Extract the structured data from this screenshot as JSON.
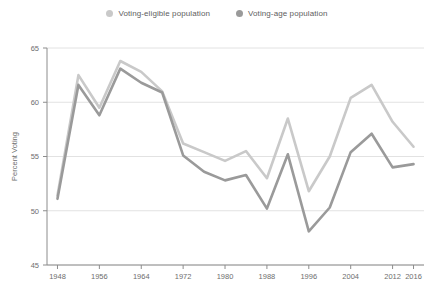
{
  "legend": {
    "position": "top-center",
    "items": [
      {
        "label": "Voting-eligible population",
        "color": "#c9c9c9",
        "marker": "circle-marker-icon"
      },
      {
        "label": "Voting-age population",
        "color": "#9a9a9a",
        "marker": "circle-marker-icon"
      }
    ]
  },
  "chart_data": {
    "type": "line",
    "title": "",
    "subtitle": "",
    "xlabel": "",
    "ylabel": "Percent Voting",
    "xlim": [
      1946,
      2018
    ],
    "ylim": [
      45,
      65
    ],
    "yticks": [
      45,
      50,
      55,
      60,
      65
    ],
    "xticks": [
      1948,
      1956,
      1964,
      1972,
      1980,
      1988,
      1996,
      2004,
      2012,
      2016
    ],
    "grid": "horizontal",
    "x": [
      1948,
      1952,
      1956,
      1960,
      1964,
      1968,
      1972,
      1976,
      1980,
      1984,
      1988,
      1992,
      1996,
      2000,
      2004,
      2008,
      2012,
      2016
    ],
    "series": [
      {
        "name": "Voting-eligible population",
        "color": "#c9c9c9",
        "values": [
          51.4,
          62.5,
          59.5,
          63.8,
          62.8,
          61.0,
          56.2,
          55.4,
          54.6,
          55.5,
          53.0,
          58.5,
          51.8,
          55.0,
          60.4,
          61.6,
          58.2,
          55.9
        ]
      },
      {
        "name": "Voting-age population",
        "color": "#9a9a9a",
        "values": [
          51.1,
          61.6,
          58.8,
          63.1,
          61.8,
          60.9,
          55.1,
          53.6,
          52.8,
          53.3,
          50.2,
          55.2,
          48.1,
          50.3,
          55.4,
          57.1,
          54.0,
          54.3
        ]
      }
    ]
  },
  "style": {
    "axis_color": "#8c8c8c",
    "grid_color": "#e2e2e2",
    "tick_text_color": "#6e6e6e",
    "background": "#ffffff"
  }
}
